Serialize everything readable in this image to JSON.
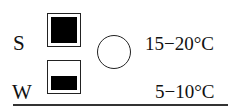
{
  "rows": [
    {
      "label": "S",
      "fill_fraction": 1.0,
      "temperature": "15−20°C"
    },
    {
      "label": "W",
      "fill_fraction": 0.45,
      "temperature": "5−10°C"
    }
  ],
  "symbol": {
    "shape": "open-circle"
  },
  "colors": {
    "fill": "#000000",
    "stroke": "#222222",
    "background": "#ffffff"
  }
}
